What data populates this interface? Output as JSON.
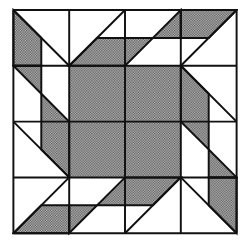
{
  "diagram": {
    "type": "quilt-block",
    "grid_units": 8,
    "size_px": 226,
    "colors": {
      "line": "#111111",
      "shade": "#8a8a8a",
      "background": "#ffffff"
    },
    "center_square": [
      [
        2,
        2
      ],
      [
        6,
        2
      ],
      [
        6,
        6
      ],
      [
        2,
        6
      ]
    ],
    "arm": {
      "parallelogram": [
        [
          2,
          2
        ],
        [
          3,
          1
        ],
        [
          5,
          1
        ],
        [
          4,
          2
        ]
      ],
      "triangle": [
        [
          5,
          1
        ],
        [
          6,
          0
        ],
        [
          6,
          1
        ]
      ],
      "trapezoid": [
        [
          6,
          0
        ],
        [
          8,
          0
        ],
        [
          7,
          1
        ],
        [
          6,
          1
        ]
      ]
    },
    "rotations": [
      0,
      90,
      180,
      270
    ]
  }
}
